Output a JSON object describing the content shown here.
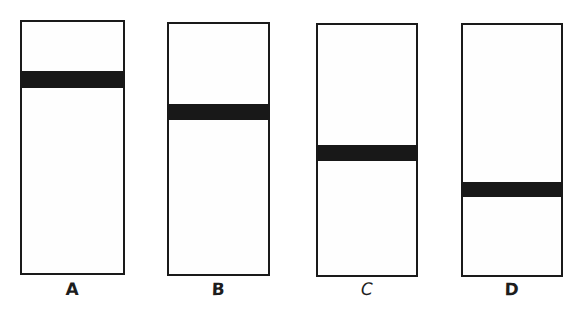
{
  "figure": {
    "background_color": "#ffffff",
    "outline_color": "#1a1a1a",
    "band_color": "#181818",
    "canvas": {
      "width": 581,
      "height": 317
    }
  },
  "columns": [
    {
      "id": "column-a",
      "label": "A",
      "box": {
        "x": 20,
        "y": 20,
        "width": 105,
        "height": 255
      },
      "band": {
        "top_offset": 51,
        "height": 17
      },
      "band_position_fraction": 0.2,
      "label_position": {
        "x": 20,
        "y": 281,
        "width": 105
      }
    },
    {
      "id": "column-b",
      "label": "B",
      "box": {
        "x": 167,
        "y": 22,
        "width": 103,
        "height": 254
      },
      "band": {
        "top_offset": 82,
        "height": 16
      },
      "band_position_fraction": 0.32,
      "label_position": {
        "x": 167,
        "y": 281,
        "width": 103
      }
    },
    {
      "id": "column-c",
      "label": "C",
      "box": {
        "x": 316,
        "y": 23,
        "width": 102,
        "height": 254
      },
      "band": {
        "top_offset": 122,
        "height": 16
      },
      "band_position_fraction": 0.48,
      "label_position": {
        "x": 316,
        "y": 281,
        "width": 102
      }
    },
    {
      "id": "column-d",
      "label": "D",
      "box": {
        "x": 461,
        "y": 23,
        "width": 102,
        "height": 254
      },
      "band": {
        "top_offset": 159,
        "height": 15
      },
      "band_position_fraction": 0.63,
      "label_position": {
        "x": 461,
        "y": 281,
        "width": 102
      }
    }
  ]
}
